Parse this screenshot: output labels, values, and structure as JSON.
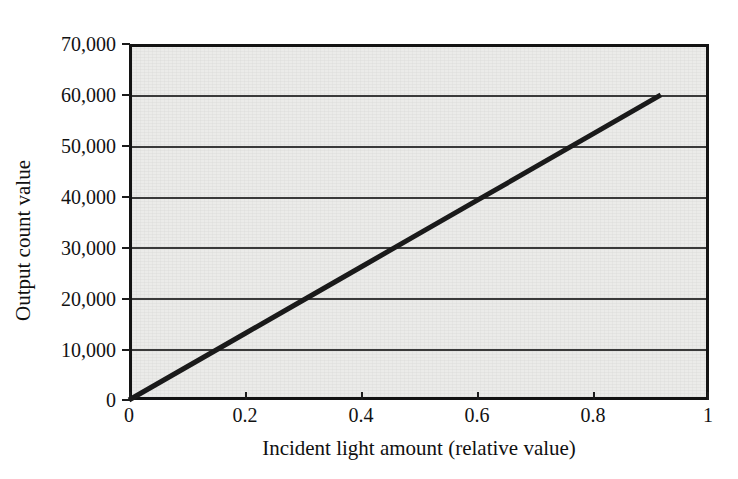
{
  "chart_data": {
    "type": "line",
    "title": "",
    "subtitle": "",
    "xlabel": "Incident light amount (relative value)",
    "ylabel": "Output count value",
    "xlim": [
      0,
      1
    ],
    "ylim": [
      0,
      70000
    ],
    "xticks": [
      "0",
      "0.2",
      "0.4",
      "0.6",
      "0.8",
      "1"
    ],
    "xtick_values": [
      0,
      0.2,
      0.4,
      0.6,
      0.8,
      1
    ],
    "yticks": [
      "0",
      "10,000",
      "20,000",
      "30,000",
      "40,000",
      "50,000",
      "60,000",
      "70,000"
    ],
    "ytick_values": [
      0,
      10000,
      20000,
      30000,
      40000,
      50000,
      60000,
      70000
    ],
    "grid": "horizontal",
    "legend": "none",
    "series": [
      {
        "name": "Photoelectric response",
        "x": [
          0,
          0.1,
          0.2,
          0.3,
          0.4,
          0.5,
          0.6,
          0.7,
          0.8,
          0.917
        ],
        "values": [
          0,
          6540,
          13080,
          19620,
          26160,
          32700,
          39240,
          45780,
          52320,
          60000
        ],
        "color": "#1a1a1a"
      }
    ],
    "annotations": []
  },
  "figure": {
    "plot_background": "#ebebe9",
    "page_background": "#ffffff",
    "frame_color": "#131313",
    "gridline_color": "#3a3a3a"
  }
}
